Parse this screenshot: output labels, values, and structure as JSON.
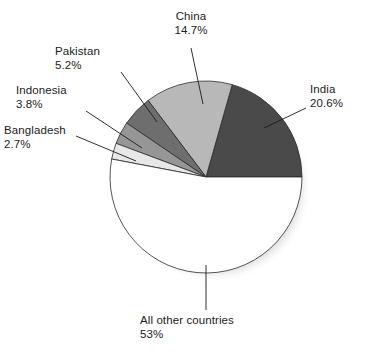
{
  "chart_data": {
    "type": "pie",
    "title": "",
    "subtitle": "",
    "xlabel": "",
    "ylabel": "",
    "legend_position": "none",
    "grid": false,
    "labels_inline": true,
    "units": "%",
    "start_angle_deg": 0,
    "direction": "counterclockwise",
    "categories": [
      "India",
      "China",
      "Pakistan",
      "Indonesia",
      "Bangladesh",
      "All other countries"
    ],
    "values": [
      20.6,
      14.7,
      5.2,
      3.8,
      2.7,
      53
    ],
    "value_labels": [
      "20.6%",
      "14.7%",
      "5.2%",
      "3.8%",
      "2.7%",
      "53%"
    ],
    "colors": [
      "#4a4a4a",
      "#b8b8b8",
      "#6e6e6e",
      "#969696",
      "#e8e8e8",
      "#ffffff"
    ],
    "slices": [
      {
        "name": "India",
        "value": 20.6,
        "value_label": "20.6%",
        "color": "#4a4a4a"
      },
      {
        "name": "China",
        "value": 14.7,
        "value_label": "14.7%",
        "color": "#b8b8b8"
      },
      {
        "name": "Pakistan",
        "value": 5.2,
        "value_label": "5.2%",
        "color": "#6e6e6e"
      },
      {
        "name": "Indonesia",
        "value": 3.8,
        "value_label": "3.8%",
        "color": "#969696"
      },
      {
        "name": "Bangladesh",
        "value": 2.7,
        "value_label": "2.7%",
        "color": "#e8e8e8"
      },
      {
        "name": "All other countries",
        "value": 53,
        "value_label": "53%",
        "color": "#ffffff"
      }
    ]
  },
  "labels": {
    "china": {
      "name": "China",
      "value": "14.7%"
    },
    "india": {
      "name": "India",
      "value": "20.6%"
    },
    "pakistan": {
      "name": "Pakistan",
      "value": "5.2%"
    },
    "indonesia": {
      "name": "Indonesia",
      "value": "3.8%"
    },
    "bangladesh": {
      "name": "Bangladesh",
      "value": "2.7%"
    },
    "other": {
      "name": "All other countries",
      "value": "53%"
    }
  },
  "style": {
    "outline_color": "#000000",
    "shadow_color": "#9a9a9a",
    "background": "#ffffff"
  }
}
